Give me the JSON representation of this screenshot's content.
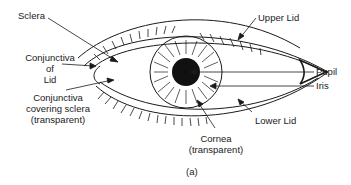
{
  "figure": {
    "caption": "(a)"
  },
  "labels": {
    "sclera": "Sclera",
    "conjunctiva_lid": [
      "Conjunctiva",
      "of",
      "Lid"
    ],
    "conjunctiva_sclera": [
      "Conjunctiva",
      "covering sclera",
      "(transparent)"
    ],
    "upper_lid": "Upper Lid",
    "pupil": "Pupil",
    "iris": "Iris",
    "lower_lid": "Lower Lid",
    "cornea": [
      "Cornea",
      "(transparent)"
    ]
  },
  "colors": {
    "line": "#1a1a1a",
    "background": "#ffffff",
    "pupil": "#111111"
  }
}
